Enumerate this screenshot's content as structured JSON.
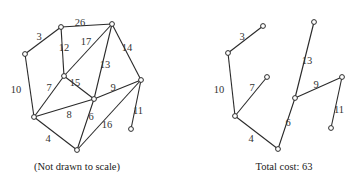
{
  "left_graph": {
    "caption": "(Not drawn to scale)",
    "nodes": {
      "A": [
        25,
        54
      ],
      "B": [
        61,
        27
      ],
      "C": [
        112,
        24
      ],
      "D": [
        64,
        76
      ],
      "E": [
        141,
        80
      ],
      "F": [
        94,
        99
      ],
      "G": [
        34,
        117
      ],
      "H": [
        77,
        150
      ],
      "I": [
        131,
        129
      ]
    },
    "edges": [
      {
        "from": "A",
        "to": "B",
        "weight": "3",
        "label_pos": [
          39,
          38
        ]
      },
      {
        "from": "B",
        "to": "C",
        "weight": "26",
        "label_pos": [
          80,
          24
        ]
      },
      {
        "from": "B",
        "to": "D",
        "weight": "12",
        "label_pos": [
          64,
          49
        ]
      },
      {
        "from": "C",
        "to": "D",
        "weight": "17",
        "label_pos": [
          86,
          43
        ]
      },
      {
        "from": "C",
        "to": "F",
        "weight": "13",
        "label_pos": [
          105,
          66
        ]
      },
      {
        "from": "C",
        "to": "E",
        "weight": "14",
        "label_pos": [
          127,
          49
        ]
      },
      {
        "from": "A",
        "to": "G",
        "weight": "10",
        "label_pos": [
          16,
          91
        ]
      },
      {
        "from": "D",
        "to": "G",
        "weight": "7",
        "label_pos": [
          49,
          89
        ]
      },
      {
        "from": "D",
        "to": "F",
        "weight": "15",
        "label_pos": [
          75,
          84
        ]
      },
      {
        "from": "G",
        "to": "F",
        "weight": "8",
        "label_pos": [
          69,
          116
        ]
      },
      {
        "from": "F",
        "to": "E",
        "weight": "9",
        "label_pos": [
          113,
          89
        ]
      },
      {
        "from": "F",
        "to": "H",
        "weight": "6",
        "label_pos": [
          91,
          118
        ]
      },
      {
        "from": "G",
        "to": "H",
        "weight": "4",
        "label_pos": [
          48,
          140
        ]
      },
      {
        "from": "E",
        "to": "H",
        "weight": "16",
        "label_pos": [
          107,
          126
        ]
      },
      {
        "from": "E",
        "to": "I",
        "weight": "11",
        "label_pos": [
          138,
          112
        ]
      }
    ]
  },
  "right_graph": {
    "caption": "Total cost: 63",
    "total_cost": 63,
    "nodes": {
      "A": [
        228,
        53
      ],
      "B": [
        263,
        26
      ],
      "C": [
        314,
        22
      ],
      "D": [
        267,
        77
      ],
      "E": [
        342,
        77
      ],
      "F": [
        295,
        98
      ],
      "G": [
        235,
        116
      ],
      "H": [
        278,
        149
      ],
      "I": [
        331,
        128
      ]
    },
    "edges": [
      {
        "from": "A",
        "to": "B",
        "weight": "3",
        "label_pos": [
          242,
          38
        ]
      },
      {
        "from": "A",
        "to": "G",
        "weight": "10",
        "label_pos": [
          219,
          91
        ]
      },
      {
        "from": "D",
        "to": "G",
        "weight": "7",
        "label_pos": [
          252,
          89
        ]
      },
      {
        "from": "G",
        "to": "H",
        "weight": "4",
        "label_pos": [
          251,
          140
        ]
      },
      {
        "from": "H",
        "to": "F",
        "weight": "6",
        "label_pos": [
          288,
          124
        ]
      },
      {
        "from": "F",
        "to": "C",
        "weight": "13",
        "label_pos": [
          307,
          62
        ]
      },
      {
        "from": "F",
        "to": "E",
        "weight": "9",
        "label_pos": [
          316,
          86
        ]
      },
      {
        "from": "E",
        "to": "I",
        "weight": "11",
        "label_pos": [
          339,
          111
        ]
      }
    ]
  }
}
